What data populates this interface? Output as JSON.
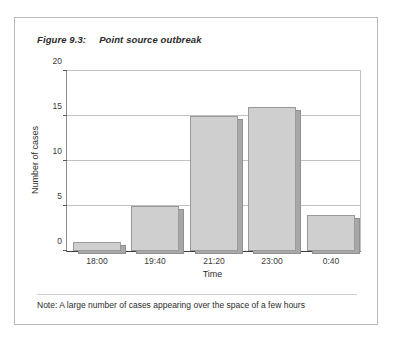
{
  "figure": {
    "number_label": "Figure 9.3:",
    "title": "Point source outbreak",
    "note": "Note: A large number of cases appearing over the space of a few hours"
  },
  "chart_data": {
    "type": "bar",
    "title": "Point source outbreak",
    "categories": [
      "18:00",
      "19:40",
      "21:20",
      "23:00",
      "0:40"
    ],
    "values": [
      1,
      5,
      15,
      16,
      4
    ],
    "xlabel": "Time",
    "ylabel": "Number of cases",
    "ylim": [
      0,
      20
    ],
    "yticks": [
      0,
      5,
      10,
      15,
      20
    ],
    "ytick_labels": [
      "0",
      "5",
      "10",
      "15",
      "20"
    ],
    "grid": "horizontal",
    "legend": "none",
    "bar_color": "#cfcfcf",
    "bar_shadow_color": "#a8a8a8",
    "bar_border_color": "#9a9a9a",
    "gridline_color": "#c2c2c2",
    "axis_color": "#3d3d3d"
  }
}
